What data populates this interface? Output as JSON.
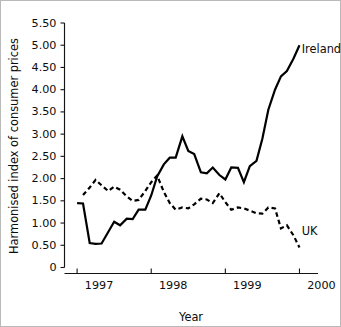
{
  "figure": {
    "border_color": "#b9b9b9",
    "background": "#ffffff",
    "ink_color": "#000000"
  },
  "axes": {
    "y_title": "Harmonised index of consumer prices",
    "x_title": "Year",
    "y_ticks": [
      "0",
      "0.50",
      "1.00",
      "1.50",
      "2.00",
      "2.50",
      "3.00",
      "3.50",
      "4.00",
      "4.50",
      "5.00",
      "5.50"
    ],
    "x_ticks": [
      "1997",
      "1998",
      "1999",
      "2000"
    ]
  },
  "labels": {
    "ireland": "Ireland",
    "uk": "UK"
  },
  "chart_data": {
    "type": "line",
    "title": "",
    "xlabel": "Year",
    "ylabel": "Harmonised index of consumer prices",
    "xlim": [
      1996.83,
      2000.25
    ],
    "ylim": [
      0,
      5.5
    ],
    "ytick_values": [
      0,
      0.5,
      1.0,
      1.5,
      2.0,
      2.5,
      3.0,
      3.5,
      4.0,
      4.5,
      5.0,
      5.5
    ],
    "xtick_values": [
      1997,
      1998,
      1999,
      2000
    ],
    "grid": false,
    "legend": "inline-series-labels",
    "series": [
      {
        "name": "Ireland",
        "style": "solid",
        "color": "#000000",
        "x": [
          1997.0,
          1997.08,
          1997.17,
          1997.25,
          1997.33,
          1997.42,
          1997.5,
          1997.58,
          1997.67,
          1997.75,
          1997.83,
          1997.92,
          1998.0,
          1998.08,
          1998.17,
          1998.25,
          1998.33,
          1998.42,
          1998.5,
          1998.58,
          1998.67,
          1998.75,
          1998.83,
          1998.92,
          1999.0,
          1999.08,
          1999.17,
          1999.25,
          1999.33,
          1999.42,
          1999.5,
          1999.58,
          1999.67,
          1999.75,
          1999.83,
          1999.92,
          2000.0
        ],
        "y": [
          1.45,
          1.44,
          0.55,
          0.53,
          0.54,
          0.8,
          1.03,
          0.95,
          1.1,
          1.09,
          1.3,
          1.3,
          1.62,
          2.05,
          2.32,
          2.47,
          2.47,
          2.95,
          2.62,
          2.55,
          2.14,
          2.12,
          2.25,
          2.08,
          1.98,
          2.25,
          2.24,
          1.92,
          2.28,
          2.4,
          2.9,
          3.55,
          4.0,
          4.3,
          4.42,
          4.7,
          5.0
        ]
      },
      {
        "name": "UK",
        "style": "dashed",
        "color": "#000000",
        "x": [
          1997.08,
          1997.17,
          1997.25,
          1997.33,
          1997.42,
          1997.5,
          1997.58,
          1997.67,
          1997.75,
          1997.83,
          1997.92,
          1998.0,
          1998.08,
          1998.17,
          1998.25,
          1998.33,
          1998.42,
          1998.5,
          1998.58,
          1998.67,
          1998.75,
          1998.83,
          1998.92,
          1999.0,
          1999.08,
          1999.17,
          1999.25,
          1999.33,
          1999.42,
          1999.5,
          1999.58,
          1999.67,
          1999.75,
          1999.83,
          1999.92,
          2000.0
        ],
        "y": [
          1.63,
          1.8,
          1.97,
          1.85,
          1.72,
          1.82,
          1.75,
          1.6,
          1.5,
          1.52,
          1.72,
          1.92,
          2.07,
          1.7,
          1.45,
          1.3,
          1.35,
          1.33,
          1.42,
          1.55,
          1.53,
          1.45,
          1.67,
          1.47,
          1.3,
          1.35,
          1.33,
          1.28,
          1.22,
          1.21,
          1.35,
          1.33,
          0.88,
          0.95,
          0.72,
          0.45
        ]
      }
    ],
    "annotations": [
      {
        "text": "Ireland",
        "x": 2000.03,
        "y": 4.9
      },
      {
        "text": "UK",
        "x": 2000.03,
        "y": 0.8
      }
    ]
  }
}
